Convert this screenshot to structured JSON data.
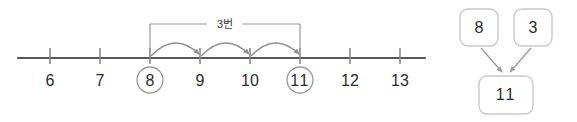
{
  "figure": {
    "title_visible": false,
    "colors": {
      "axis_line": "#565656",
      "tick": "#8a8a8a",
      "arc": "#8f8f8f",
      "bracket": "#9a9a9a",
      "circle_marker": "#9a9a9a",
      "box_border": "#c9c9c9",
      "box_arrow": "#9a9a9a",
      "label_text": "#2b2b2b",
      "background": "#ffffff"
    }
  },
  "numberline": {
    "ticks": [
      {
        "label": "6",
        "value": 6,
        "circled": false
      },
      {
        "label": "7",
        "value": 7,
        "circled": false
      },
      {
        "label": "8",
        "value": 8,
        "circled": true
      },
      {
        "label": "9",
        "value": 9,
        "circled": false
      },
      {
        "label": "10",
        "value": 10,
        "circled": false
      },
      {
        "label": "11",
        "value": 11,
        "circled": true
      },
      {
        "label": "12",
        "value": 12,
        "circled": false
      },
      {
        "label": "13",
        "value": 13,
        "circled": false
      }
    ],
    "hops": {
      "label": "3번",
      "count": 3,
      "from_value": 8,
      "to_value": 11,
      "steps": [
        {
          "from": 8,
          "to": 9
        },
        {
          "from": 9,
          "to": 10
        },
        {
          "from": 10,
          "to": 11
        }
      ]
    }
  },
  "box_diagram": {
    "addend_left": "8",
    "addend_right": "3",
    "sum": "11"
  }
}
